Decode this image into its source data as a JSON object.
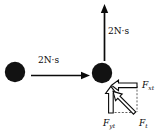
{
  "figure": {
    "type": "physics-vector-diagram",
    "background_color": "#ffffff",
    "ink_color": "#0a0a0a"
  },
  "bodies": [
    {
      "name": "left-ball",
      "shape": "filled-circle",
      "cx": 15,
      "cy": 72,
      "r": 10,
      "color": "#111111"
    },
    {
      "name": "right-ball",
      "shape": "filled-circle",
      "cx": 102,
      "cy": 73,
      "r": 10,
      "color": "#111111"
    }
  ],
  "impulse_arrows": [
    {
      "name": "horizontal-impulse-arrow",
      "label": "2N·s",
      "direction": "right",
      "x1": 32,
      "y1": 75,
      "x2": 88,
      "y2": 75
    },
    {
      "name": "vertical-impulse-arrow",
      "label": "2N·s",
      "direction": "up",
      "x1": 104,
      "y1": 61,
      "x2": 104,
      "y2": 5
    }
  ],
  "force_diagram": {
    "origin": {
      "x": 137,
      "y": 113
    },
    "components": [
      {
        "name": "x-component-arrow",
        "label": "F",
        "subscript": "xt",
        "direction": "left",
        "style": "hollow-outline"
      },
      {
        "name": "y-component-arrow",
        "label": "F",
        "subscript": "yt",
        "direction": "up",
        "style": "hollow-outline"
      },
      {
        "name": "resultant-arrow",
        "label": "F",
        "subscript": "t",
        "direction": "up-left-diagonal",
        "style": "hollow-outline"
      }
    ],
    "guides": "dashed-rectangle"
  },
  "labels": {
    "impulse_horizontal": "2N·s",
    "impulse_vertical": "2N·s",
    "f_x": "F",
    "f_x_sub": "xt",
    "f_y": "F",
    "f_y_sub": "yt",
    "f_total": "F",
    "f_total_sub": "t"
  }
}
